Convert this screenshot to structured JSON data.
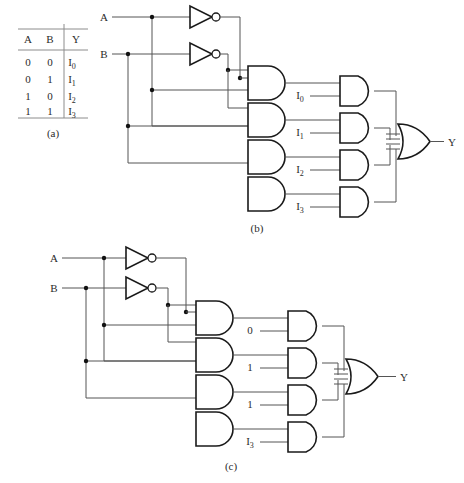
{
  "figure": {
    "captions": {
      "a": "(a)",
      "b": "(b)",
      "c": "(c)"
    }
  },
  "truth_table": {
    "headers": [
      "A",
      "B",
      "Y"
    ],
    "rows": [
      {
        "a": "0",
        "b": "0",
        "y_base": "I",
        "y_sub": "0"
      },
      {
        "a": "0",
        "b": "1",
        "y_base": "I",
        "y_sub": "1"
      },
      {
        "a": "1",
        "b": "0",
        "y_base": "I",
        "y_sub": "2"
      },
      {
        "a": "1",
        "b": "1",
        "y_base": "I",
        "y_sub": "3"
      }
    ]
  },
  "circuit_b": {
    "inputs": [
      {
        "label": "A"
      },
      {
        "label": "B"
      }
    ],
    "inverters": [
      "not-a",
      "not-b"
    ],
    "decoder_gates": [
      "and-minterm-0",
      "and-minterm-1",
      "and-minterm-2",
      "and-minterm-3"
    ],
    "data_inputs": [
      {
        "base": "I",
        "sub": "0"
      },
      {
        "base": "I",
        "sub": "1"
      },
      {
        "base": "I",
        "sub": "2"
      },
      {
        "base": "I",
        "sub": "3"
      }
    ],
    "select_gates": [
      "and-select-0",
      "and-select-1",
      "and-select-2",
      "and-select-3"
    ],
    "or_gate": "or-output",
    "output": {
      "label": "Y"
    }
  },
  "circuit_c": {
    "inputs": [
      {
        "label": "A"
      },
      {
        "label": "B"
      }
    ],
    "inverters": [
      "not-a",
      "not-b"
    ],
    "decoder_gates": [
      "and-minterm-0",
      "and-minterm-1",
      "and-minterm-2",
      "and-minterm-3"
    ],
    "data_inputs": [
      {
        "base": "0",
        "sub": ""
      },
      {
        "base": "1",
        "sub": ""
      },
      {
        "base": "1",
        "sub": ""
      },
      {
        "base": "I",
        "sub": "3"
      }
    ],
    "select_gates": [
      "and-select-0",
      "and-select-1",
      "and-select-2",
      "and-select-3"
    ],
    "or_gate": "or-output",
    "output": {
      "label": "Y"
    }
  }
}
